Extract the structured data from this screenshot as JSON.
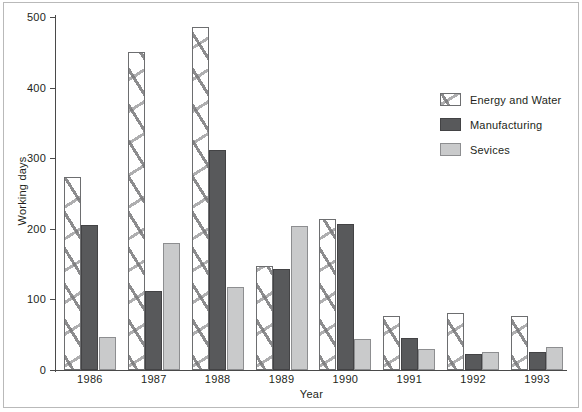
{
  "figure": {
    "ylabel": "Working days",
    "xlabel": "Year"
  },
  "legend": {
    "items": [
      {
        "label": "Energy and Water",
        "swatch": "hatched-white-swatch",
        "color": "#ffffff"
      },
      {
        "label": "Manufacturing",
        "swatch": "dark-gray-swatch",
        "color": "#58595b"
      },
      {
        "label": "Sevices",
        "swatch": "light-gray-swatch",
        "color": "#c9cacb"
      }
    ]
  },
  "yticks": [
    {
      "label": "500",
      "value": 500
    },
    {
      "label": "400",
      "value": 400
    },
    {
      "label": "300",
      "value": 300
    },
    {
      "label": "200",
      "value": 200
    },
    {
      "label": "100",
      "value": 100
    },
    {
      "label": "0",
      "value": 0
    }
  ],
  "chart_data": {
    "type": "bar",
    "title": "",
    "xlabel": "Year",
    "ylabel": "Working days",
    "ylim": [
      0,
      500
    ],
    "yticks": [
      0,
      100,
      200,
      300,
      400,
      500
    ],
    "grid": false,
    "legend_position": "right",
    "categories": [
      "1986",
      "1987",
      "1988",
      "1989",
      "1990",
      "1991",
      "1992",
      "1993"
    ],
    "series": [
      {
        "name": "Energy and Water",
        "color": "#ffffff",
        "pattern": "hatched",
        "values": [
          273,
          450,
          486,
          147,
          214,
          76,
          81,
          76
        ]
      },
      {
        "name": "Manufacturing",
        "color": "#58595b",
        "pattern": "solid",
        "values": [
          205,
          112,
          311,
          143,
          207,
          46,
          23,
          26
        ]
      },
      {
        "name": "Sevices",
        "color": "#c9cacb",
        "pattern": "solid",
        "values": [
          47,
          180,
          118,
          204,
          44,
          30,
          26,
          33
        ]
      }
    ]
  }
}
